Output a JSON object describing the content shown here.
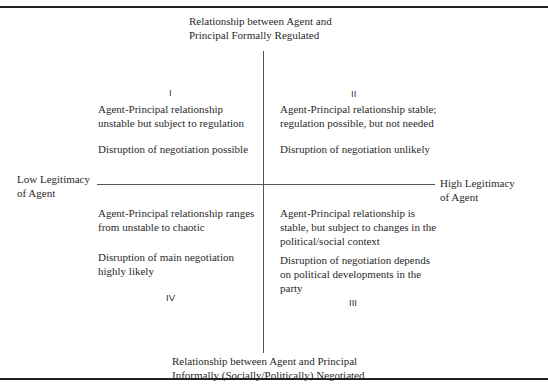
{
  "caption_cut": "Relationship between Agent and Principal",
  "axes": {
    "top_label": [
      "Relationship between Agent and",
      "Principal Formally Regulated"
    ],
    "bottom_label": [
      "Relationship between Agent and Principal",
      "Informally (Socially/Politically) Negotiated"
    ],
    "left_label": [
      "Low Legitimacy",
      "of Agent"
    ],
    "right_label": [
      "High Legitimacy",
      "of Agent"
    ]
  },
  "quadrants": [
    {
      "numeral": "I",
      "relationship": [
        "Agent-Principal relationship",
        "unstable but subject to regulation"
      ],
      "disruption": [
        "Disruption of negotiation possible"
      ]
    },
    {
      "numeral": "II",
      "relationship": [
        "Agent-Principal relationship stable;",
        "regulation possible, but not needed"
      ],
      "disruption": [
        "Disruption of negotiation unlikely"
      ]
    },
    {
      "numeral": "III",
      "relationship": [
        "Agent-Principal relationship is",
        "stable, but subject to changes in the",
        "political/social context"
      ],
      "disruption": [
        "Disruption of negotiation depends",
        "on political developments in the",
        "party"
      ]
    },
    {
      "numeral": "IV",
      "relationship": [
        "Agent-Principal relationship ranges",
        "from unstable to chaotic"
      ],
      "disruption": [
        "Disruption of main negotiation",
        "highly likely"
      ]
    }
  ]
}
